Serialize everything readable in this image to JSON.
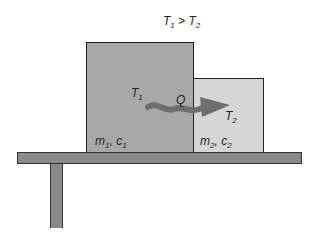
{
  "condition": {
    "T1": "T",
    "T1_sub": "1",
    "op": ">",
    "T2": "T",
    "T2_sub": "2"
  },
  "block1": {
    "temp": "T",
    "temp_sub": "1",
    "m": "m",
    "m_sub": "1",
    "c": "c",
    "c_sub": "1",
    "color": "#a8a8a8"
  },
  "block2": {
    "temp": "T",
    "temp_sub": "2",
    "m": "m",
    "m_sub": "2",
    "c": "c",
    "c_sub": "2",
    "color": "#d6d6d6"
  },
  "heat": {
    "label": "Q",
    "color": "#6e6e6e"
  },
  "table": {
    "color": "#8a8a8a"
  }
}
